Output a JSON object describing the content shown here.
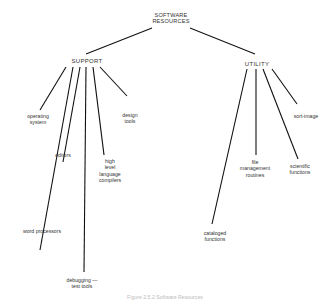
{
  "diagram": {
    "type": "tree",
    "root": {
      "label": "SOFTWARE\nRESOURCES"
    },
    "branches": [
      {
        "label": "SUPPORT",
        "children": [
          {
            "label": "operating\nsystem"
          },
          {
            "label": "word processors"
          },
          {
            "label": "editors"
          },
          {
            "label": "debugging —\ntest tools"
          },
          {
            "label": "high\nlevel\nlanguage\ncompilers"
          },
          {
            "label": "design\ntools"
          }
        ]
      },
      {
        "label": "UTILITY",
        "children": [
          {
            "label": "cataloged\nfunctions"
          },
          {
            "label": "file\nmanagement\nroutines"
          },
          {
            "label": "scientific\nfunctions"
          },
          {
            "label": "sort-image"
          }
        ]
      }
    ],
    "caption": "Figure 2.5.2 Software Resources",
    "line_color": "#111111"
  }
}
